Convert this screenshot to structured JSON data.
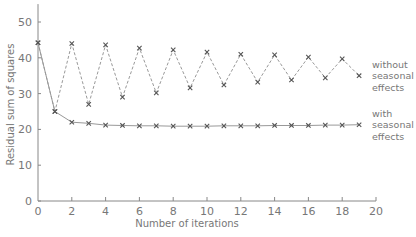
{
  "chart_data": {
    "type": "line",
    "title": "",
    "xlabel": "Number of iterations",
    "ylabel": "Residual sum of squares",
    "xlim": [
      0,
      20
    ],
    "ylim": [
      0,
      55
    ],
    "x_ticks": [
      0,
      2,
      4,
      6,
      8,
      10,
      12,
      14,
      16,
      18,
      20
    ],
    "y_ticks": [
      0,
      10,
      20,
      30,
      40,
      50
    ],
    "grid": false,
    "legend_position": "inline-right",
    "x": [
      0,
      1,
      2,
      3,
      4,
      5,
      6,
      7,
      8,
      9,
      10,
      11,
      12,
      13,
      14,
      15,
      16,
      17,
      18,
      19
    ],
    "series": [
      {
        "name": "without seasonal effects",
        "label_lines": [
          "without",
          "seasonal",
          "effects"
        ],
        "style": "dashed",
        "marker": "x",
        "values": [
          44.2,
          25.0,
          44.0,
          27.0,
          43.6,
          29.0,
          42.7,
          30.2,
          42.2,
          31.6,
          41.6,
          32.4,
          41.0,
          33.2,
          40.8,
          33.8,
          40.2,
          34.4,
          39.7,
          35.0
        ]
      },
      {
        "name": "with seasonal effects",
        "label_lines": [
          "with",
          "seasonal",
          "effects"
        ],
        "style": "solid",
        "marker": "x",
        "values": [
          44.2,
          25.0,
          22.0,
          21.7,
          21.2,
          21.1,
          21.0,
          21.0,
          20.9,
          20.9,
          20.9,
          21.0,
          21.0,
          21.0,
          21.1,
          21.1,
          21.1,
          21.2,
          21.2,
          21.3
        ]
      }
    ]
  }
}
